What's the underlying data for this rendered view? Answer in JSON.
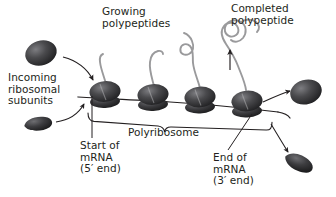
{
  "figure": {
    "background_color": "#ffffff",
    "ink_color": "#231f20",
    "subunit_color": "#3a3a3c",
    "chain_color": "#8c8c8e",
    "width": 336,
    "height": 197
  },
  "labels": {
    "growing_polypeptides": "Growing\npolypeptides",
    "growing_polypeptides_line1": "Growing",
    "growing_polypeptides_line2": "polypeptides",
    "completed_polypeptide_line1": "Completed",
    "completed_polypeptide_line2": "polypeptide",
    "incoming_subunits_line1": "Incoming",
    "incoming_subunits_line2": "ribosomal",
    "incoming_subunits_line3": "subunits",
    "start_mrna_line1": "Start of",
    "start_mrna_line2": "mRNA",
    "start_mrna_line3": "(5′ end)",
    "end_mrna_line1": "End of",
    "end_mrna_line2": "mRNA",
    "end_mrna_line3": "(3′ end)",
    "polyribosome": "Polyribosome"
  },
  "diagram_elements": {
    "ribosome_count": 4,
    "ribosomes": [
      {
        "index": 1,
        "x": 104,
        "y": 96,
        "chain_length": "short"
      },
      {
        "index": 2,
        "x": 152,
        "y": 99,
        "chain_length": "medium"
      },
      {
        "index": 3,
        "x": 200,
        "y": 101,
        "chain_length": "long"
      },
      {
        "index": 4,
        "x": 246,
        "y": 104,
        "chain_length": "longest"
      }
    ],
    "free_large_subunit_left": {
      "x": 40,
      "y": 52
    },
    "free_small_subunit_left": {
      "x": 38,
      "y": 122
    },
    "free_large_subunit_right": {
      "x": 305,
      "y": 92
    },
    "free_small_subunit_right": {
      "x": 299,
      "y": 163
    },
    "mrna_strand": {
      "start_x": 78,
      "start_y": 98,
      "end_x": 278,
      "end_y": 112
    },
    "brace_label": "Polyribosome"
  }
}
